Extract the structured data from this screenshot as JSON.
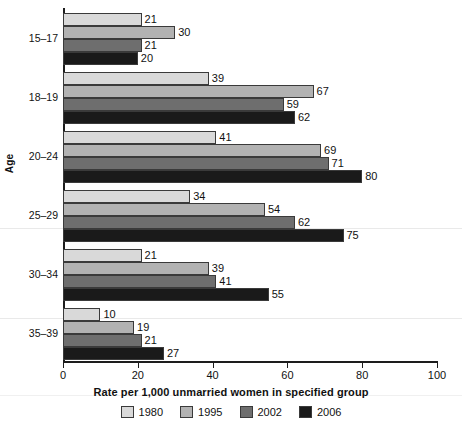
{
  "chart_data": {
    "type": "bar",
    "orientation": "horizontal",
    "title": "",
    "xlabel": "Rate per 1,000 unmarried women in specified group",
    "ylabel": "Age",
    "categories": [
      "15–17",
      "18–19",
      "20–24",
      "25–29",
      "30–34",
      "35–39"
    ],
    "series": [
      {
        "name": "1980",
        "color": "#d9d9d9",
        "values": [
          21,
          39,
          41,
          34,
          21,
          10
        ]
      },
      {
        "name": "1995",
        "color": "#b2b2b2",
        "values": [
          30,
          67,
          69,
          54,
          39,
          19
        ]
      },
      {
        "name": "2002",
        "color": "#6e6e6e",
        "values": [
          21,
          59,
          71,
          62,
          41,
          21
        ]
      },
      {
        "name": "2006",
        "color": "#1a1a1a",
        "values": [
          20,
          62,
          80,
          75,
          55,
          27
        ]
      }
    ],
    "xlim": [
      0,
      100
    ],
    "xticks": [
      0,
      20,
      40,
      60,
      80,
      100
    ],
    "xtick_labels": [
      "0",
      "20",
      "40",
      "60",
      "80",
      "100"
    ],
    "grid": false,
    "legend_position": "bottom",
    "value_labels_shown": true
  },
  "axes": {
    "y_title": "Age",
    "x_title": "Rate per 1,000 unmarried women in specified group"
  }
}
